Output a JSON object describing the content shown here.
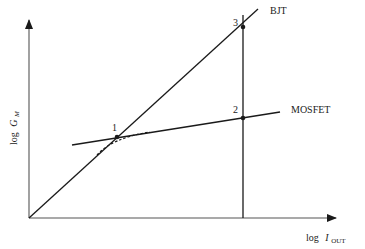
{
  "diagram": {
    "y_axis_label": {
      "prefix": "log",
      "symbol": "G",
      "subscript": "M"
    },
    "x_axis_label": {
      "prefix": "log",
      "symbol": "I",
      "subscript": "OUT"
    },
    "lines": {
      "bjt": {
        "label": "BJT"
      },
      "mosfet": {
        "label": "MOSFET"
      }
    },
    "points": [
      {
        "id": "1",
        "label": "1"
      },
      {
        "id": "2",
        "label": "2"
      },
      {
        "id": "3",
        "label": "3"
      }
    ],
    "colors": {
      "line": "#1a1a1a",
      "axis": "#555555",
      "text": "#222222"
    }
  }
}
